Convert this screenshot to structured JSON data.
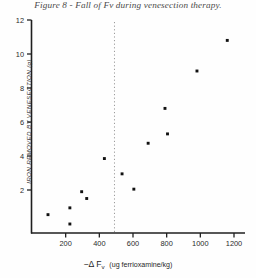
{
  "figure": {
    "caption": "Figure 8 - Fall of Fv during venesection therapy.",
    "background_color": "#fefefe",
    "ink_color": "#1f1f1f"
  },
  "chart_data": {
    "type": "scatter",
    "title": "Figure 8 - Fall of Fv during venesection therapy.",
    "xlabel": "-Δ Fᵥ  (ug ferrioxamine/kg)",
    "xlabel_parts": {
      "prefix": "−Δ F",
      "subscript": "v",
      "units": "(ug ferrioxamine/kg)"
    },
    "ylabel": "IRON REMOVED BY VENESECTION (g)",
    "xlim": [
      0,
      1260
    ],
    "ylim": [
      0,
      12
    ],
    "xticks": [
      200,
      400,
      600,
      800,
      1000,
      1200
    ],
    "xtick_labels": [
      "200",
      "400",
      "600",
      "800",
      "1000",
      "1200"
    ],
    "yticks": [
      2,
      4,
      6,
      8,
      10,
      12
    ],
    "ytick_labels": [
      "2",
      "4",
      "6",
      "8",
      "10",
      "12"
    ],
    "grid": false,
    "legend": null,
    "marker": "filled-square",
    "marker_color": "#111111",
    "annotations": [
      {
        "name": "threshold-line",
        "type": "vertical-dashed-line",
        "x": 490,
        "color": "#9a9a9a",
        "style": "dotted"
      }
    ],
    "points": [
      {
        "x": 95,
        "y": 0.55
      },
      {
        "x": 225,
        "y": 0.95
      },
      {
        "x": 225,
        "y": 0.0
      },
      {
        "x": 295,
        "y": 1.9
      },
      {
        "x": 325,
        "y": 1.5
      },
      {
        "x": 430,
        "y": 3.85
      },
      {
        "x": 535,
        "y": 2.95
      },
      {
        "x": 605,
        "y": 2.05
      },
      {
        "x": 690,
        "y": 4.75
      },
      {
        "x": 790,
        "y": 6.8
      },
      {
        "x": 805,
        "y": 5.3
      },
      {
        "x": 980,
        "y": 9.0
      },
      {
        "x": 1160,
        "y": 10.8
      }
    ]
  }
}
